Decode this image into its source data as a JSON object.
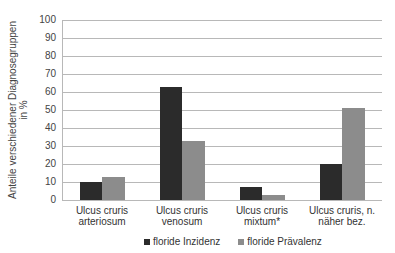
{
  "chart_data": {
    "type": "bar",
    "title": "",
    "xlabel": "",
    "ylabel": "Anteile verschiedener Diagnosegruppen in %",
    "ylabel_lines": [
      "Anteile verschiedener Diagnosegruppen",
      "in %"
    ],
    "ylim": [
      0,
      100
    ],
    "yticks": [
      0,
      10,
      20,
      30,
      40,
      50,
      60,
      70,
      80,
      90,
      100
    ],
    "grid": true,
    "legend_position": "bottom",
    "categories": [
      "Ulcus cruris arteriosum",
      "Ulcus cruris venosum",
      "Ulcus cruris mixtum*",
      "Ulcus cruris, n. näher bez."
    ],
    "category_lines": [
      [
        "Ulcus cruris",
        "arteriosum"
      ],
      [
        "Ulcus cruris",
        "venosum"
      ],
      [
        "Ulcus cruris",
        "mixtum*"
      ],
      [
        "Ulcus cruris, n.",
        "näher bez."
      ]
    ],
    "series": [
      {
        "name": "floride Inzidenz",
        "color": "#2b2b2b",
        "values": [
          10,
          63,
          7,
          20
        ]
      },
      {
        "name": "floride Prävalenz",
        "color": "#8c8c8c",
        "values": [
          13,
          33,
          3,
          51
        ]
      }
    ]
  }
}
